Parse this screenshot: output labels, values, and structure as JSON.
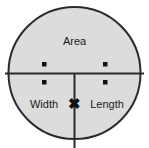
{
  "diagram": {
    "shape": "circle",
    "fill_color": "#dcdcdc",
    "stroke_color": "#2b2b2b",
    "background_color": "#ffffff",
    "sections": {
      "top": {
        "label": "Area",
        "name": "area"
      },
      "bottom_left": {
        "label": "Width",
        "name": "width"
      },
      "bottom_right": {
        "label": "Length",
        "name": "length"
      }
    },
    "operators": {
      "divide_left": {
        "symbol": "÷",
        "name": "divide"
      },
      "divide_right": {
        "symbol": "÷",
        "name": "divide"
      },
      "multiply": {
        "symbol": "✖",
        "name": "multiply"
      }
    },
    "relations": [
      "Area ÷ Width = Length",
      "Area ÷ Length = Width",
      "Width ✖ Length = Area"
    ]
  }
}
